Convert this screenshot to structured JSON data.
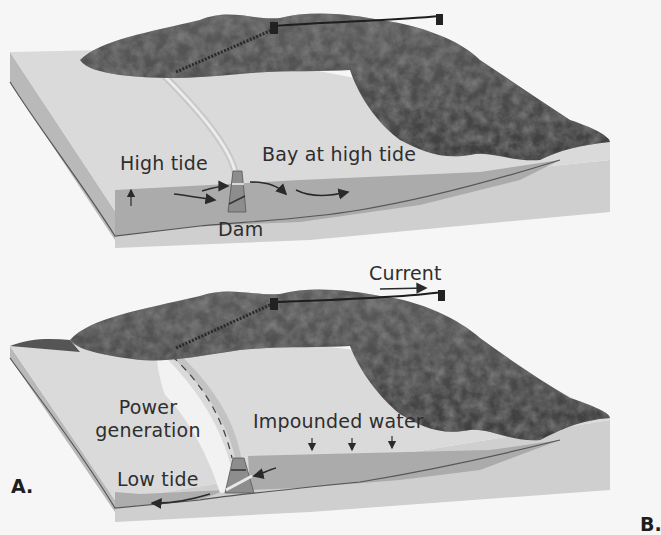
{
  "figure": {
    "panels": [
      {
        "id": "top",
        "description": "Bay at high tide, water flowing in through dam",
        "labels": {
          "high_tide": "High tide",
          "bay": "Bay at high tide",
          "dam": "Dam"
        }
      },
      {
        "id": "bottom",
        "description": "Low tide, impounded water flows out through turbines",
        "labels": {
          "current": "Current",
          "power_generation_line1": "Power",
          "power_generation_line2": "generation",
          "impounded_water": "Impounded water",
          "low_tide": "Low tide"
        }
      }
    ],
    "panel_letters": {
      "a": "A.",
      "b": "B."
    }
  },
  "colors": {
    "background": "#f6f6f6",
    "land_top": "#d9d9d9",
    "block_side": "#b5b5b5",
    "water": "#a9a9a9",
    "mountain_dark": "#4a4a4a",
    "mountain_mid": "#7a7a7a",
    "dam": "#8e8e8e",
    "text": "#2e2e2e"
  }
}
